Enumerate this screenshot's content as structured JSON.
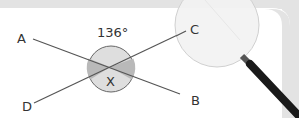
{
  "diagram": {
    "angle_label": "136°",
    "intersection_label": "X",
    "points": {
      "A": "A",
      "B": "B",
      "C": "C",
      "D": "D"
    },
    "lines": [
      {
        "name": "line-AB",
        "from": "A",
        "to": "B"
      },
      {
        "name": "line-DC",
        "from": "D",
        "to": "C"
      }
    ],
    "colors": {
      "frame": "#e3e3e3",
      "line": "#555555",
      "circle_fill": "#dedede",
      "shaded_fill": "#b9b9b9",
      "lens_fill": "#f2f2f2",
      "handle": "#1a1a1a"
    }
  }
}
